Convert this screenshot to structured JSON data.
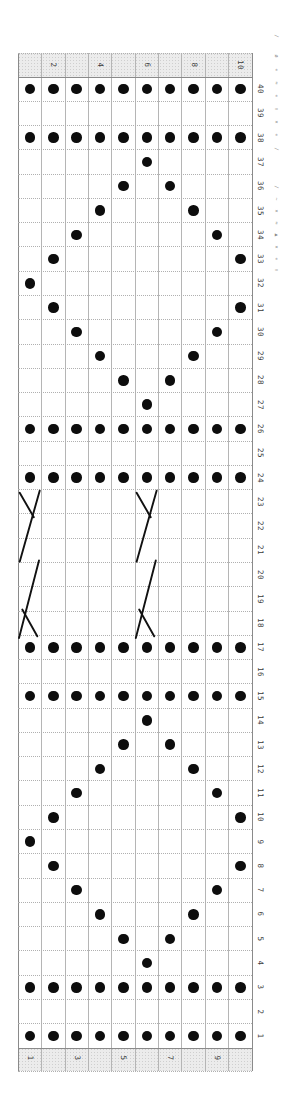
{
  "chart_data": {
    "type": "knitting-chart-grid",
    "columns": 10,
    "rows": 40,
    "top_column_labels": [
      {
        "col": 2,
        "text": "2"
      },
      {
        "col": 4,
        "text": "4"
      },
      {
        "col": 6,
        "text": "6"
      },
      {
        "col": 8,
        "text": "8"
      },
      {
        "col": 10,
        "text": "10"
      }
    ],
    "bottom_column_labels": [
      {
        "col": 1,
        "text": "1"
      },
      {
        "col": 3,
        "text": "3"
      },
      {
        "col": 5,
        "text": "5"
      },
      {
        "col": 7,
        "text": "7"
      },
      {
        "col": 9,
        "text": "9"
      }
    ],
    "row_labels": [
      "40",
      "39",
      "38",
      "37",
      "36",
      "35",
      "34",
      "33",
      "32",
      "31",
      "30",
      "29",
      "28",
      "27",
      "26",
      "25",
      "24",
      "23",
      "22",
      "21",
      "20",
      "19",
      "18",
      "17",
      "16",
      "15",
      "14",
      "13",
      "12",
      "11",
      "10",
      "9",
      "8",
      "7",
      "6",
      "5",
      "4",
      "3",
      "2",
      "1"
    ],
    "purl_dots": [
      {
        "row": 40,
        "cols": "all"
      },
      {
        "row": 38,
        "cols": "all"
      },
      {
        "row": 37,
        "cols": [
          6
        ]
      },
      {
        "row": 36,
        "cols": [
          5,
          7
        ]
      },
      {
        "row": 35,
        "cols": [
          4,
          8
        ]
      },
      {
        "row": 34,
        "cols": [
          3,
          9
        ]
      },
      {
        "row": 33,
        "cols": [
          2,
          10
        ]
      },
      {
        "row": 32,
        "cols": [
          1
        ]
      },
      {
        "row": 31,
        "cols": [
          2,
          10
        ]
      },
      {
        "row": 30,
        "cols": [
          3,
          9
        ]
      },
      {
        "row": 29,
        "cols": [
          4,
          8
        ]
      },
      {
        "row": 28,
        "cols": [
          5,
          7
        ]
      },
      {
        "row": 27,
        "cols": [
          6
        ]
      },
      {
        "row": 26,
        "cols": "all"
      },
      {
        "row": 24,
        "cols": "all"
      },
      {
        "row": 17,
        "cols": "all"
      },
      {
        "row": 15,
        "cols": "all"
      },
      {
        "row": 14,
        "cols": [
          6
        ]
      },
      {
        "row": 13,
        "cols": [
          5,
          7
        ]
      },
      {
        "row": 12,
        "cols": [
          4,
          8
        ]
      },
      {
        "row": 11,
        "cols": [
          3,
          9
        ]
      },
      {
        "row": 10,
        "cols": [
          2,
          10
        ]
      },
      {
        "row": 9,
        "cols": [
          1
        ]
      },
      {
        "row": 8,
        "cols": [
          2,
          10
        ]
      },
      {
        "row": 7,
        "cols": [
          3,
          9
        ]
      },
      {
        "row": 6,
        "cols": [
          4,
          8
        ]
      },
      {
        "row": 5,
        "cols": [
          5,
          7
        ]
      },
      {
        "row": 4,
        "cols": [
          6
        ]
      },
      {
        "row": 3,
        "cols": "all"
      },
      {
        "row": 1,
        "cols": "all"
      }
    ],
    "cable_symbols": [
      {
        "type": "y-cross",
        "col": 1,
        "top_row": 23,
        "row_span": 3
      },
      {
        "type": "y-cross",
        "col": 6,
        "top_row": 23,
        "row_span": 3
      },
      {
        "type": "k-cross",
        "col": 1,
        "top_row": 20,
        "row_span": 3
      },
      {
        "type": "k-cross",
        "col": 6,
        "top_row": 20,
        "row_span": 3
      }
    ],
    "margin_legend_marks": [
      {
        "y": 36,
        "text": "∕"
      },
      {
        "y": 56,
        "text": "ø"
      },
      {
        "y": 70,
        "text": "«"
      },
      {
        "y": 83,
        "text": "≈"
      },
      {
        "y": 96,
        "text": "«"
      },
      {
        "y": 109,
        "text": "∧"
      },
      {
        "y": 122,
        "text": "×"
      },
      {
        "y": 135,
        "text": "«"
      },
      {
        "y": 149,
        "text": "∕"
      },
      {
        "y": 187,
        "text": "∕"
      },
      {
        "y": 199,
        "text": "~"
      },
      {
        "y": 211,
        "text": "×"
      },
      {
        "y": 223,
        "text": "≈"
      },
      {
        "y": 235,
        "text": "▲"
      },
      {
        "y": 247,
        "text": "×"
      },
      {
        "y": 259,
        "text": "«"
      },
      {
        "y": 270,
        "text": "∧"
      }
    ]
  },
  "colors": {
    "background": "#ffffff",
    "dot": "#0d0d0d",
    "symbol_stroke": "#111111",
    "grid_line": "#b5b5b5",
    "border_line": "#8a8a8a",
    "band_background": "#ececec",
    "label_text": "#3a3a3a",
    "legend_mark": "#8a8a8a"
  }
}
